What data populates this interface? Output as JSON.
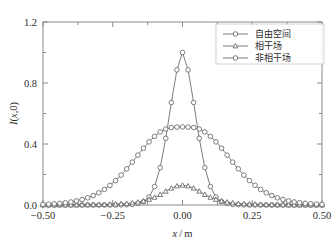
{
  "chart_data": {
    "type": "line",
    "title": "",
    "xlabel": "x/m",
    "ylabel": "I(x,0)",
    "xlim": [
      -0.5,
      0.5
    ],
    "ylim": [
      0.0,
      1.2
    ],
    "grid": false,
    "legend_position": "top-right",
    "x_ticks": [
      -0.5,
      -0.25,
      0.0,
      0.25,
      0.5
    ],
    "x_tick_labels": [
      "−0.50",
      "−0.25",
      "0.00",
      "0.25",
      "0.50"
    ],
    "x_minor_ticks": [
      -0.375,
      -0.125,
      0.125,
      0.375
    ],
    "y_ticks": [
      0.0,
      0.4,
      0.8,
      1.2
    ],
    "y_tick_labels": [
      "0.0",
      "0.4",
      "0.8",
      "1.2"
    ],
    "y_minor_ticks": [
      0.2,
      0.6,
      1.0
    ],
    "x": [
      -0.5,
      -0.48,
      -0.46,
      -0.44,
      -0.42,
      -0.4,
      -0.38,
      -0.36,
      -0.34,
      -0.32,
      -0.3,
      -0.28,
      -0.26,
      -0.24,
      -0.22,
      -0.2,
      -0.18,
      -0.16,
      -0.14,
      -0.12,
      -0.1,
      -0.08,
      -0.06,
      -0.04,
      -0.02,
      0.0,
      0.02,
      0.04,
      0.06,
      0.08,
      0.1,
      0.12,
      0.14,
      0.16,
      0.18,
      0.2,
      0.22,
      0.24,
      0.26,
      0.28,
      0.3,
      0.32,
      0.34,
      0.36,
      0.38,
      0.4,
      0.42,
      0.44,
      0.46,
      0.48,
      0.5
    ],
    "series": [
      {
        "name": "自由空间",
        "marker": "circle",
        "values": [
          0.0,
          0.0,
          0.0,
          0.0,
          0.0,
          0.0,
          0.0,
          0.0,
          0.0,
          0.0,
          0.0,
          0.0,
          0.0,
          0.0,
          0.001,
          0.002,
          0.004,
          0.01,
          0.022,
          0.052,
          0.121,
          0.245,
          0.437,
          0.672,
          0.886,
          1.0,
          0.886,
          0.672,
          0.437,
          0.245,
          0.121,
          0.052,
          0.022,
          0.01,
          0.004,
          0.002,
          0.001,
          0.0,
          0.0,
          0.0,
          0.0,
          0.0,
          0.0,
          0.0,
          0.0,
          0.0,
          0.0,
          0.0,
          0.0,
          0.0,
          0.0
        ]
      },
      {
        "name": "相干场",
        "marker": "triangle",
        "values": [
          0.0,
          0.0,
          0.0,
          0.0,
          0.0,
          0.0,
          0.0,
          0.001,
          0.001,
          0.002,
          0.002,
          0.003,
          0.004,
          0.005,
          0.007,
          0.009,
          0.013,
          0.018,
          0.025,
          0.036,
          0.05,
          0.068,
          0.09,
          0.11,
          0.124,
          0.129,
          0.124,
          0.11,
          0.09,
          0.068,
          0.05,
          0.036,
          0.025,
          0.018,
          0.013,
          0.009,
          0.007,
          0.005,
          0.004,
          0.003,
          0.002,
          0.002,
          0.001,
          0.001,
          0.0,
          0.0,
          0.0,
          0.0,
          0.0,
          0.0,
          0.0
        ]
      },
      {
        "name": "非相干场",
        "marker": "circle",
        "values": [
          0.004,
          0.006,
          0.008,
          0.011,
          0.015,
          0.02,
          0.027,
          0.036,
          0.047,
          0.062,
          0.08,
          0.102,
          0.129,
          0.16,
          0.196,
          0.237,
          0.281,
          0.327,
          0.372,
          0.414,
          0.45,
          0.479,
          0.498,
          0.508,
          0.511,
          0.512,
          0.511,
          0.508,
          0.498,
          0.479,
          0.45,
          0.414,
          0.372,
          0.327,
          0.281,
          0.237,
          0.196,
          0.16,
          0.129,
          0.102,
          0.08,
          0.062,
          0.047,
          0.036,
          0.027,
          0.02,
          0.015,
          0.011,
          0.008,
          0.006,
          0.004
        ]
      }
    ]
  },
  "legend": {
    "entries": [
      {
        "label": "自由空间"
      },
      {
        "label": "相干场"
      },
      {
        "label": "非相干场"
      }
    ]
  },
  "style": {
    "line_color": "#6e6e6e",
    "frame_color": "#8a8a8a",
    "text_color": "#2b2b2b",
    "background": "#ffffff"
  }
}
